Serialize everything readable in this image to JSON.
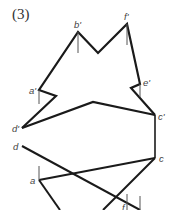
{
  "figure": {
    "number_label": "(3)",
    "stroke_color": "#1a1a1a",
    "thin_stroke_color": "#555555",
    "points": {
      "b_prime": {
        "label": "b'",
        "x": 78,
        "y": 32
      },
      "f_prime": {
        "label": "f'",
        "x": 127,
        "y": 24
      },
      "e_prime": {
        "label": "e'",
        "x": 140,
        "y": 84
      },
      "a_prime": {
        "label": "a'",
        "x": 39,
        "y": 90
      },
      "d_prime": {
        "label": "d'",
        "x": 22,
        "y": 128
      },
      "c_prime": {
        "label": "c'",
        "x": 155,
        "y": 115
      },
      "d": {
        "label": "d",
        "x": 22,
        "y": 146
      },
      "c": {
        "label": "c",
        "x": 155,
        "y": 158
      },
      "a": {
        "label": "a",
        "x": 39,
        "y": 180
      },
      "f": {
        "label": "f",
        "x": 124,
        "y": 206
      }
    }
  }
}
